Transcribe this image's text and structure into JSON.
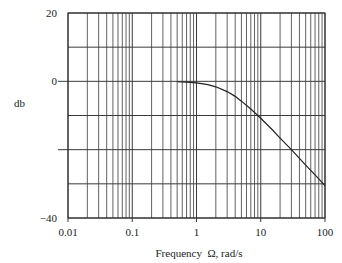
{
  "chart_data": {
    "type": "line",
    "title": "",
    "xlabel": "Frequency  Ω, rad/s",
    "ylabel": "db",
    "xscale": "log",
    "xlim": [
      0.01,
      100
    ],
    "ylim": [
      -40,
      20
    ],
    "x_tick_labels": [
      "0.01",
      "0.1",
      "1",
      "10",
      "100"
    ],
    "x_ticks": [
      0.01,
      0.1,
      1,
      10,
      100
    ],
    "y_tick_labels": [
      "20",
      "0",
      "−40"
    ],
    "y_ticks_labeled": [
      20,
      0,
      -40
    ],
    "y_gridlines": [
      20,
      10,
      0,
      -10,
      -20,
      -30,
      -40
    ],
    "grid": true,
    "legend": null,
    "series": [
      {
        "name": "magnitude",
        "x": [
          0.5,
          0.7,
          1,
          1.5,
          2,
          3,
          4,
          5,
          7,
          10,
          15,
          20,
          30,
          50,
          70,
          100
        ],
        "values": [
          -0.12,
          -0.23,
          -0.46,
          -0.97,
          -1.6,
          -3.0,
          -4.4,
          -5.8,
          -8.1,
          -10.8,
          -14.1,
          -16.6,
          -20.0,
          -24.5,
          -27.4,
          -30.5
        ]
      }
    ]
  },
  "colors": {
    "grid": "#3a3a3a",
    "curve": "#222222",
    "background": "#ffffff"
  }
}
